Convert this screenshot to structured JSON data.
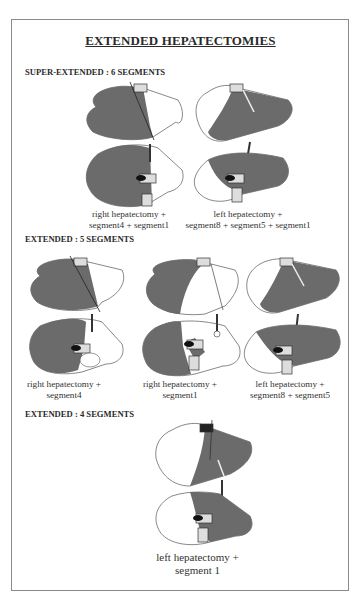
{
  "title": "EXTENDED HEPATECTOMIES",
  "sections": [
    {
      "heading": "SUPER-EXTENDED : 6 SEGMENTS",
      "figures": [
        {
          "caption": [
            "right hepatectomy +",
            "segment4 + segment1"
          ],
          "resected": "right"
        },
        {
          "caption": [
            "left hepatectomy +",
            "segment8 + segment5 + segment1"
          ],
          "resected": "left"
        }
      ]
    },
    {
      "heading": "EXTENDED : 5 SEGMENTS",
      "figures": [
        {
          "caption": [
            "right hepatectomy +",
            "segment4"
          ],
          "resected": "right"
        },
        {
          "caption": [
            "right hepatectomy +",
            "segment1"
          ],
          "resected": "right"
        },
        {
          "caption": [
            "left hepatectomy +",
            "segment8 + segment5"
          ],
          "resected": "left"
        }
      ]
    },
    {
      "heading": "EXTENDED : 4 SEGMENTS",
      "figures": [
        {
          "caption": [
            "left hepatectomy +",
            "segment 1"
          ],
          "resected": "left"
        }
      ]
    }
  ],
  "colors": {
    "liver_fill": "#6b6b6b",
    "outline": "#555555",
    "border": "#8a8a8a"
  }
}
